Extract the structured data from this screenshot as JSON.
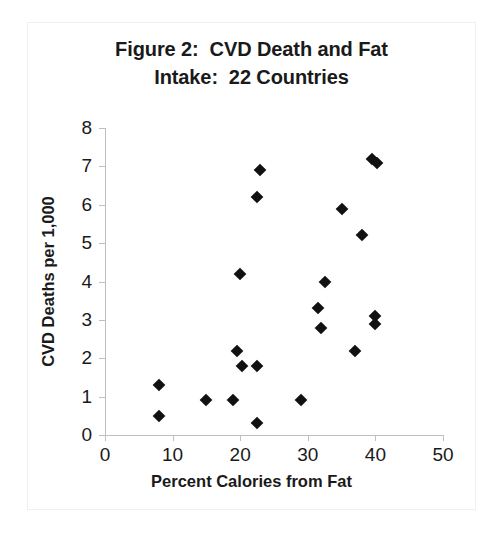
{
  "chart_data": {
    "type": "scatter",
    "title": "Figure 2:  CVD Death and Fat Intake:  22 Countries",
    "title_lines": [
      "Figure 2:  CVD Death and Fat",
      "Intake:  22 Countries"
    ],
    "xlabel": "Percent Calories from Fat",
    "ylabel": "CVD Deaths per 1,000",
    "xlim": [
      0,
      50
    ],
    "ylim": [
      0,
      8
    ],
    "xticks": [
      0,
      10,
      20,
      30,
      40,
      50
    ],
    "yticks": [
      0,
      1,
      2,
      3,
      4,
      5,
      6,
      7,
      8
    ],
    "xtick_labels": [
      "0",
      "10",
      "20",
      "30",
      "40",
      "50"
    ],
    "ytick_labels": [
      "0",
      "1",
      "2",
      "3",
      "4",
      "5",
      "6",
      "7",
      "8"
    ],
    "grid": false,
    "legend": false,
    "marker_shape": "diamond",
    "marker_color": "#111111",
    "series": [
      {
        "name": "Countries",
        "points": [
          {
            "x": 8.0,
            "y": 1.3
          },
          {
            "x": 8.0,
            "y": 0.5
          },
          {
            "x": 15.0,
            "y": 0.9
          },
          {
            "x": 19.0,
            "y": 0.9
          },
          {
            "x": 19.5,
            "y": 2.2
          },
          {
            "x": 20.0,
            "y": 4.2
          },
          {
            "x": 20.2,
            "y": 1.8
          },
          {
            "x": 22.5,
            "y": 1.8
          },
          {
            "x": 22.5,
            "y": 0.3
          },
          {
            "x": 22.5,
            "y": 6.2
          },
          {
            "x": 23.0,
            "y": 6.9
          },
          {
            "x": 29.0,
            "y": 0.9
          },
          {
            "x": 31.5,
            "y": 3.3
          },
          {
            "x": 32.0,
            "y": 2.8
          },
          {
            "x": 32.5,
            "y": 4.0
          },
          {
            "x": 35.0,
            "y": 5.9
          },
          {
            "x": 37.0,
            "y": 2.2
          },
          {
            "x": 38.0,
            "y": 5.2
          },
          {
            "x": 39.5,
            "y": 7.2
          },
          {
            "x": 40.3,
            "y": 7.1
          },
          {
            "x": 40.0,
            "y": 3.1
          },
          {
            "x": 40.0,
            "y": 2.9
          }
        ]
      }
    ]
  }
}
